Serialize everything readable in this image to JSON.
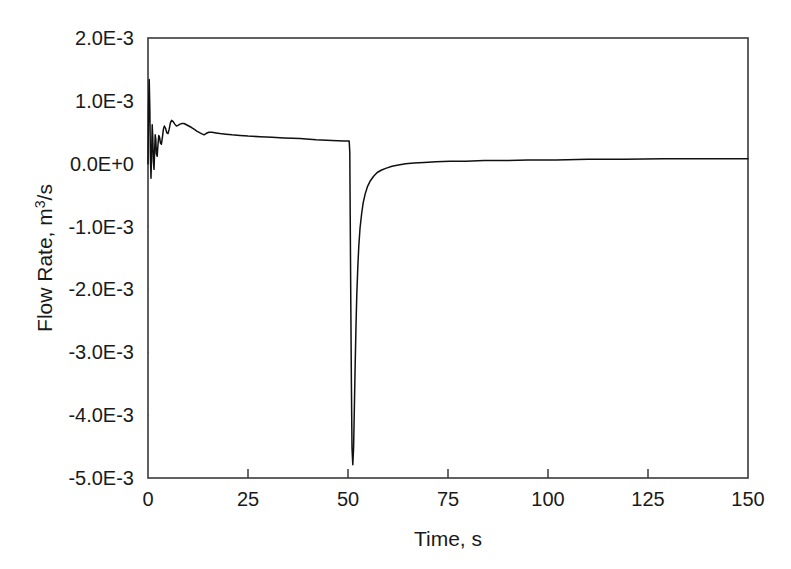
{
  "chart_data": {
    "type": "line",
    "title": "",
    "xlabel": "Time, s",
    "ylabel": "Flow Rate, m3/s",
    "ylabel_parts": {
      "lead": "Flow Rate, m",
      "sup": "3",
      "tail": "/s"
    },
    "xlim": [
      0,
      150
    ],
    "ylim": [
      -0.005,
      0.002
    ],
    "xticks": [
      0,
      25,
      50,
      75,
      100,
      125,
      150
    ],
    "xtick_labels": [
      "0",
      "25",
      "50",
      "75",
      "100",
      "125",
      "150"
    ],
    "yticks": [
      0.002,
      0.001,
      0.0,
      -0.001,
      -0.002,
      -0.003,
      -0.004,
      -0.005
    ],
    "ytick_labels": [
      "2.0E-3",
      "1.0E-3",
      "0.0E+0",
      "-1.0E+0",
      "-2.0E-3",
      "-3.0E-3",
      "-4.0E-3",
      "-5.0E-3"
    ],
    "ytick_labels_shown": [
      "2.0E-3",
      "1.0E-3",
      "0.0E+0",
      "-1.0E-3",
      "-2.0E-3",
      "-3.0E-3",
      "-4.0E-3",
      "-5.0E-3"
    ],
    "grid": false,
    "legend": null,
    "line_color": "#101010",
    "frame_color": "#3a3a3a",
    "background": "#ffffff",
    "annotations": [],
    "series": [
      {
        "name": "Flow Rate",
        "x": [
          0.0,
          0.15,
          0.3,
          0.45,
          0.6,
          0.75,
          0.9,
          1.05,
          1.2,
          1.35,
          1.5,
          1.65,
          1.8,
          1.95,
          2.1,
          2.3,
          2.5,
          2.7,
          2.9,
          3.1,
          3.35,
          3.6,
          3.85,
          4.1,
          4.4,
          4.7,
          5.0,
          5.3,
          5.6,
          5.9,
          6.3,
          6.7,
          7.1,
          7.5,
          8.0,
          8.5,
          9.0,
          9.6,
          10.2,
          10.8,
          11.5,
          12.2,
          13.0,
          13.6,
          14.0,
          14.5,
          15.2,
          16.0,
          17.0,
          18.0,
          19.5,
          21.0,
          23.0,
          25.0,
          28.0,
          31.0,
          34.0,
          38.0,
          42.0,
          46.0,
          49.0,
          50.3,
          50.45,
          50.55,
          50.7,
          50.85,
          51.0,
          51.2,
          51.4,
          51.6,
          51.8,
          52.0,
          52.2,
          52.45,
          52.7,
          53.0,
          53.4,
          53.8,
          54.3,
          54.9,
          55.6,
          56.4,
          57.3,
          58.4,
          59.6,
          61.0,
          62.6,
          64.4,
          66.5,
          69.0,
          72.0,
          75.5,
          79.5,
          84.0,
          89.0,
          95.0,
          102.0,
          110.0,
          119.0,
          129.0,
          139.0,
          150.0
        ],
        "y": [
          0.0,
          0.00092,
          0.00134,
          0.00091,
          0.00012,
          -0.00023,
          0.00016,
          0.00062,
          0.00041,
          4e-05,
          -9e-05,
          0.00018,
          0.00046,
          0.00039,
          0.00016,
          0.00012,
          0.00031,
          0.00045,
          0.00042,
          0.00033,
          0.00031,
          0.00042,
          0.00055,
          0.0006,
          0.00056,
          0.00049,
          0.00048,
          0.00055,
          0.00065,
          0.00069,
          0.00067,
          0.00063,
          0.0006,
          0.00061,
          0.00063,
          0.00064,
          0.00064,
          0.00062,
          0.0006,
          0.00058,
          0.00055,
          0.00052,
          0.00049,
          0.00047,
          0.00046,
          0.00048,
          0.0005,
          0.0005,
          0.00049,
          0.00048,
          0.00047,
          0.00046,
          0.00045,
          0.00044,
          0.00043,
          0.00042,
          0.00041,
          0.0004,
          0.00038,
          0.00037,
          0.00036,
          0.00036,
          0.00018,
          -0.0008,
          -0.0022,
          -0.0035,
          -0.00452,
          -0.00479,
          -0.00452,
          -0.00386,
          -0.00318,
          -0.00258,
          -0.00208,
          -0.00165,
          -0.00131,
          -0.00103,
          -0.0008,
          -0.00062,
          -0.00048,
          -0.00036,
          -0.00027,
          -0.0002,
          -0.00014,
          -0.0001,
          -7e-05,
          -4e-05,
          -2e-05,
          0.0,
          1e-05,
          2e-05,
          3e-05,
          4e-05,
          4e-05,
          5e-05,
          5e-05,
          6e-05,
          6e-05,
          7e-05,
          7e-05,
          8e-05,
          8e-05,
          8e-05
        ]
      }
    ],
    "notable_features": {
      "initial_peak_value": 0.00134,
      "initial_peak_time": 0.3,
      "pre_transient_plateau": 0.00036,
      "transient_time": 50.5,
      "minimum_value": -0.00479,
      "minimum_time": 51.2,
      "final_value": 8e-05
    }
  },
  "layout": {
    "plot_left_px": 148,
    "plot_right_px": 748,
    "plot_top_px": 38,
    "plot_bottom_px": 478
  }
}
